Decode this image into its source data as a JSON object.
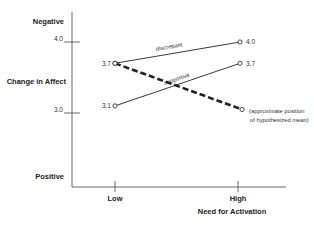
{
  "chart_data": {
    "type": "line",
    "title": "",
    "xlabel": "Need for Activation",
    "ylabel": "Change in Affect",
    "y_top_label": "Negative",
    "y_bottom_label": "Positive",
    "categories": [
      "Low",
      "High"
    ],
    "yticks": [
      {
        "value": 4.0,
        "label": "4.0"
      },
      {
        "value": 3.0,
        "label": "3.0"
      }
    ],
    "ylim": [
      2.1,
      4.4
    ],
    "grid": false,
    "series": [
      {
        "name": "discrepant",
        "style": "solid",
        "values": [
          3.7,
          4.0
        ],
        "point_labels": [
          "3.7",
          "4.0"
        ]
      },
      {
        "name": "supportive",
        "style": "solid",
        "values": [
          3.1,
          3.7
        ],
        "point_labels": [
          "3.1",
          "3.7"
        ]
      },
      {
        "name": "hypothesized mean",
        "style": "dashed",
        "values": [
          3.7,
          3.05
        ],
        "point_labels": [
          "",
          ""
        ]
      }
    ],
    "annotations": [
      {
        "text_line1": "(approximate position",
        "text_line2": "of hypothesized mean)",
        "attached_to": "hypothesized mean",
        "at": "High"
      }
    ]
  }
}
